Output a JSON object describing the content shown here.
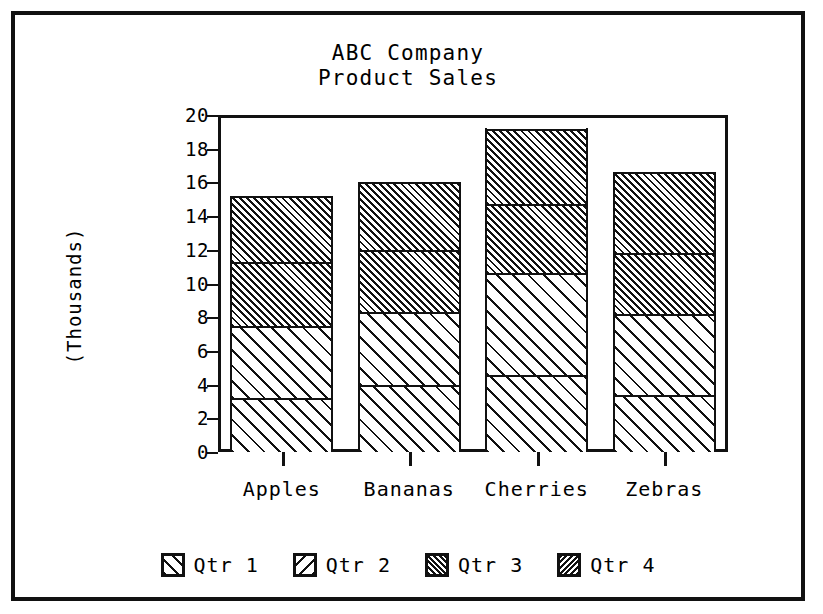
{
  "chart_data": {
    "type": "bar",
    "subtype": "stacked-bar",
    "title": "ABC Company",
    "subtitle": "Product Sales",
    "xlabel": "",
    "ylabel": "(Thousands)",
    "ylim": [
      0,
      20
    ],
    "yticks": [
      0,
      2,
      4,
      6,
      8,
      10,
      12,
      14,
      16,
      18,
      20
    ],
    "ytick_labels": [
      "0",
      "2",
      "4",
      "6",
      "8",
      "10",
      "12",
      "14",
      "16",
      "18",
      "20"
    ],
    "grid": false,
    "legend_position": "bottom",
    "categories": [
      "Apples",
      "Bananas",
      "Cherries",
      "Zebras"
    ],
    "series": [
      {
        "name": "Qtr 1",
        "pattern": "forward-hatch-wide",
        "values": [
          3.2,
          4.0,
          4.6,
          3.4
        ]
      },
      {
        "name": "Qtr 2",
        "pattern": "back-hatch-wide",
        "values": [
          4.3,
          4.3,
          6.0,
          4.8
        ]
      },
      {
        "name": "Qtr 3",
        "pattern": "forward-hatch-dense",
        "values": [
          3.8,
          3.7,
          4.1,
          3.6
        ]
      },
      {
        "name": "Qtr 4",
        "pattern": "back-hatch-dense",
        "values": [
          3.9,
          4.0,
          4.5,
          4.8
        ]
      }
    ],
    "totals": [
      15.2,
      16.0,
      19.2,
      16.6
    ]
  },
  "legend": {
    "items": [
      {
        "label": "Qtr 1"
      },
      {
        "label": "Qtr 2"
      },
      {
        "label": "Qtr 3"
      },
      {
        "label": "Qtr 4"
      }
    ]
  },
  "colors": {
    "ink": "#111111",
    "paper": "#ffffff"
  }
}
